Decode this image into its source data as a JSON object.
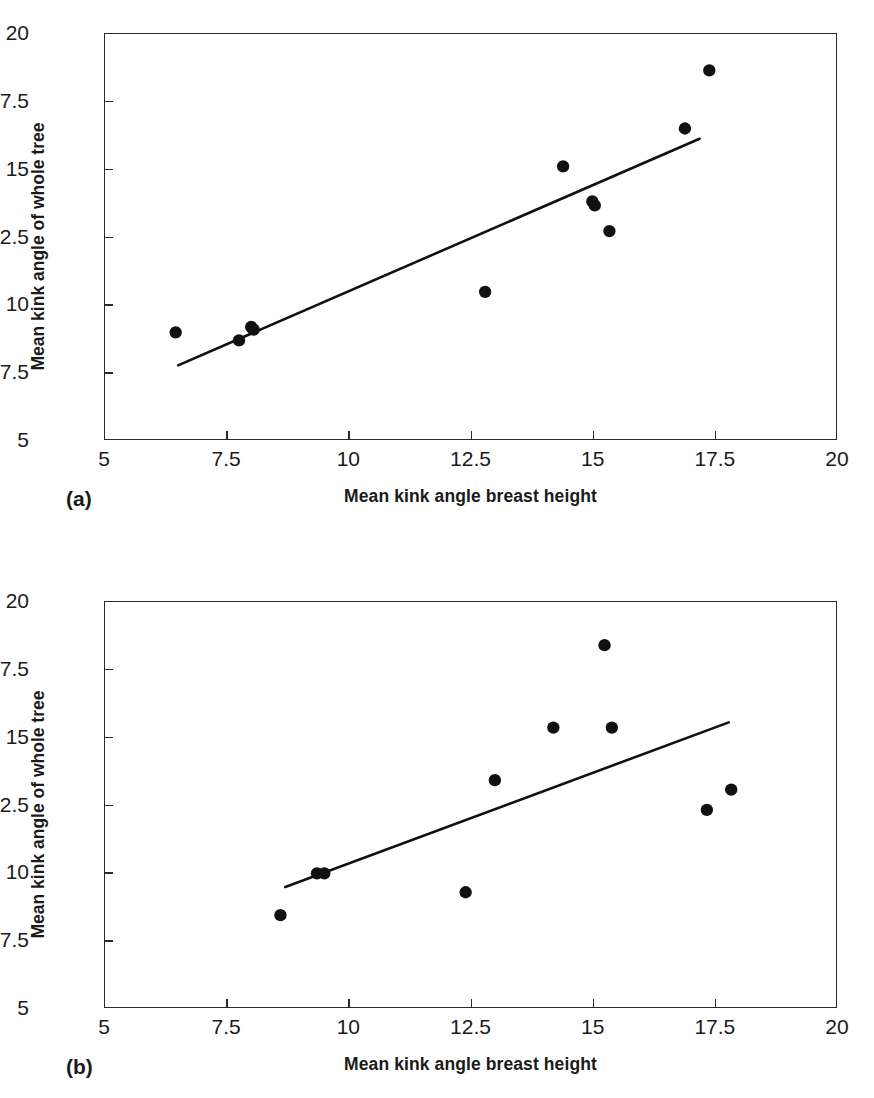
{
  "figure": {
    "panels": [
      {
        "label": "(a)",
        "equation": {
          "lhs": "Kink",
          "lhs_sub": "tree",
          "eq": " = ",
          "slope": "0.7843",
          "paren_open": "(Kink",
          "var_sub": "bh",
          "paren_close": ")",
          "plus": " + ",
          "intercept": "2.6299",
          "r2_label": "R",
          "r2_sup": "2",
          "r2_eq": " = ",
          "r2_value": "0.8228",
          "full_line1": "Kinktree = 0.7843(Kinkbh) + 2.6299",
          "full_line2": "R2 = 0.8228"
        }
      },
      {
        "label": "(b)",
        "equation": {
          "lhs": "Kink",
          "lhs_sub": "tree",
          "eq": " = ",
          "slope": "0.6702",
          "paren_open": "(Kink",
          "var_sub": "bh",
          "paren_close": ")",
          "plus": " + ",
          "intercept": "3.6134",
          "r2_label": "R",
          "r2_sup": "2",
          "r2_eq": " = ",
          "r2_value": "0.4597",
          "full_line1": "Kinktree = 0.6702(Kinkbh) + 3.6134",
          "full_line2": "R2 = 0.4597"
        }
      }
    ]
  },
  "chart_data": [
    {
      "type": "scatter",
      "panel": "(a)",
      "title": "",
      "xlabel": "Mean kink angle breast height",
      "ylabel": "Mean kink angle of whole tree",
      "xlim": [
        5,
        20
      ],
      "ylim": [
        5,
        20
      ],
      "xticks": [
        5,
        7.5,
        10,
        12.5,
        15,
        17.5,
        20
      ],
      "yticks": [
        5,
        7.5,
        10,
        12.5,
        15,
        17.5,
        20
      ],
      "xticklabels": [
        "5",
        "7.5",
        "10",
        "12.5",
        "15",
        "17.5",
        "20"
      ],
      "yticklabels": [
        "5",
        "7.5",
        "10",
        "12.5",
        "15",
        "17.5",
        "20"
      ],
      "grid": false,
      "legend": false,
      "marker": "filled-circle",
      "marker_color": "#111111",
      "points": [
        {
          "x": 6.45,
          "y": 8.95
        },
        {
          "x": 7.75,
          "y": 8.65
        },
        {
          "x": 8.0,
          "y": 9.15
        },
        {
          "x": 8.05,
          "y": 9.05
        },
        {
          "x": 12.8,
          "y": 10.45
        },
        {
          "x": 14.4,
          "y": 15.1
        },
        {
          "x": 15.0,
          "y": 13.8
        },
        {
          "x": 15.05,
          "y": 13.65
        },
        {
          "x": 15.35,
          "y": 12.7
        },
        {
          "x": 16.9,
          "y": 16.5
        },
        {
          "x": 17.4,
          "y": 18.65
        }
      ],
      "fit_line": {
        "slope": 0.7843,
        "intercept": 2.6299,
        "x_start": 6.5,
        "x_end": 17.2,
        "color": "#111111",
        "equation_text": "Kink_tree = 0.7843(Kink_bh) + 2.6299",
        "r_squared": 0.8228
      }
    },
    {
      "type": "scatter",
      "panel": "(b)",
      "title": "",
      "xlabel": "Mean kink angle breast height",
      "ylabel": "Mean kink angle of whole tree",
      "xlim": [
        5,
        20
      ],
      "ylim": [
        5,
        20
      ],
      "xticks": [
        5,
        7.5,
        10,
        12.5,
        15,
        17.5,
        20
      ],
      "yticks": [
        5,
        7.5,
        10,
        12.5,
        15,
        17.5,
        20
      ],
      "xticklabels": [
        "5",
        "7.5",
        "10",
        "12.5",
        "15",
        "17.5",
        "20"
      ],
      "yticklabels": [
        "5",
        "7.5",
        "10",
        "12.5",
        "15",
        "17.5",
        "20"
      ],
      "grid": false,
      "legend": false,
      "marker": "filled-circle",
      "marker_color": "#111111",
      "points": [
        {
          "x": 8.6,
          "y": 8.4
        },
        {
          "x": 9.35,
          "y": 9.95
        },
        {
          "x": 9.5,
          "y": 9.95
        },
        {
          "x": 12.4,
          "y": 9.25
        },
        {
          "x": 13.0,
          "y": 13.4
        },
        {
          "x": 14.2,
          "y": 15.35
        },
        {
          "x": 15.25,
          "y": 18.4
        },
        {
          "x": 15.4,
          "y": 15.35
        },
        {
          "x": 17.35,
          "y": 12.3
        },
        {
          "x": 17.85,
          "y": 13.05
        }
      ],
      "fit_line": {
        "slope": 0.6702,
        "intercept": 3.6134,
        "x_start": 8.7,
        "x_end": 17.8,
        "color": "#111111",
        "equation_text": "Kink_tree = 0.6702(Kink_bh) + 3.6134",
        "r_squared": 0.4597
      }
    }
  ]
}
